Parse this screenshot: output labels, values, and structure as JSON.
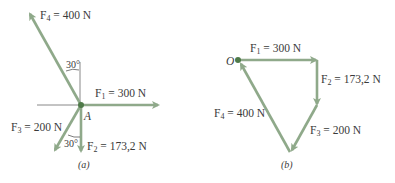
{
  "colors": {
    "vector": "#8fa98a",
    "vector_dark": "#7d9b78",
    "point": "#4f7a49",
    "reference_line": "#6a6a6a",
    "text": "#3a3a3a"
  },
  "panel_a": {
    "caption": "(a)",
    "point_label": "A",
    "forces": [
      {
        "name": "F",
        "sub": "4",
        "value": "= 400 N"
      },
      {
        "name": "F",
        "sub": "1",
        "value": "= 300 N"
      },
      {
        "name": "F",
        "sub": "3",
        "value": "= 200 N"
      },
      {
        "name": "F",
        "sub": "2",
        "value": "= 173,2 N"
      }
    ],
    "angles": [
      "30°",
      "30°"
    ]
  },
  "panel_b": {
    "caption": "(b)",
    "origin_label": "O",
    "forces": [
      {
        "name": "F",
        "sub": "1",
        "value": "= 300 N"
      },
      {
        "name": "F",
        "sub": "2",
        "value": "= 173,2 N"
      },
      {
        "name": "F",
        "sub": "4",
        "value": "= 400 N"
      },
      {
        "name": "F",
        "sub": "3",
        "value": "= 200 N"
      }
    ]
  }
}
